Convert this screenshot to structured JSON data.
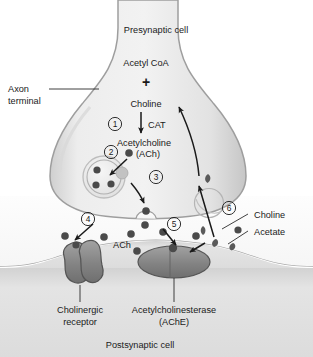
{
  "diagram": {
    "cells": {
      "presynaptic": "Presynaptic cell",
      "postsynaptic": "Postsynaptic cell"
    },
    "labels": {
      "axon_terminal_line1": "Axon",
      "axon_terminal_line2": "terminal",
      "acetyl_coa": "Acetyl CoA",
      "plus": "+",
      "choline": "Choline",
      "cat": "CAT",
      "acetylcholine": "Acetylcholine",
      "ach_paren": "(ACh)",
      "ach_cleft": "ACh",
      "cholinergic_receptor_line1": "Cholinergic",
      "cholinergic_receptor_line2": "receptor",
      "ache_line1": "Acetylcholinesterase",
      "ache_line2": "(AChE)",
      "choline_product": "Choline",
      "acetate_product": "Acetate"
    },
    "steps": [
      {
        "number": "1",
        "meaning": "synthesis-of-acetylcholine-by-CAT"
      },
      {
        "number": "2",
        "meaning": "packaging-of-ach-into-synaptic-vesicle"
      },
      {
        "number": "3",
        "meaning": "exocytosis-of-ach-into-synaptic-cleft"
      },
      {
        "number": "4",
        "meaning": "ach-binds-cholinergic-receptor"
      },
      {
        "number": "5",
        "meaning": "ach-degraded-by-acetylcholinesterase"
      },
      {
        "number": "6",
        "meaning": "choline-reuptake-into-axon-terminal"
      }
    ],
    "colors": {
      "terminal_fill": "#e6e6e6",
      "terminal_edge": "#9a9a9a",
      "postsynaptic_fill": "#dedede",
      "cleft_fill": "#fbfbfb",
      "protein_fill": "#8c8c8c",
      "protein_edge": "#4f4f4f",
      "molecule_fill": "#4a4a4a",
      "text": "#1a1a1a"
    }
  }
}
